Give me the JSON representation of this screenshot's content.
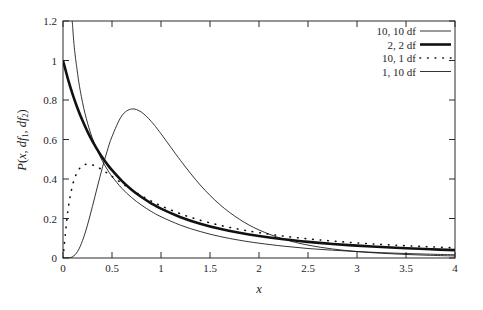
{
  "chart_data": {
    "type": "line",
    "title": "",
    "subtitle": "",
    "xlabel": "x",
    "ylabel": "P(x, df1, df2)",
    "ylabel_display": "P(x, df₁, df₂)",
    "xlim": [
      0,
      4
    ],
    "ylim": [
      0,
      1.2
    ],
    "grid": false,
    "legend_position": "top-right",
    "xticks": [
      "0",
      "0.5",
      "1",
      "1.5",
      "2",
      "2.5",
      "3",
      "3.5",
      "4"
    ],
    "xtick_values": [
      0,
      0.5,
      1,
      1.5,
      2,
      2.5,
      3,
      3.5,
      4
    ],
    "yticks": [
      "0",
      "0.2",
      "0.4",
      "0.6",
      "0.8",
      "1",
      "1.2"
    ],
    "ytick_values": [
      0,
      0.2,
      0.4,
      0.6,
      0.8,
      1,
      1.2
    ],
    "x": [
      0.0,
      0.05,
      0.1,
      0.15,
      0.2,
      0.25,
      0.3,
      0.35,
      0.4,
      0.45,
      0.5,
      0.6,
      0.7,
      0.8,
      0.9,
      1.0,
      1.2,
      1.4,
      1.6,
      1.8,
      2.0,
      2.25,
      2.5,
      2.75,
      3.0,
      3.25,
      3.5,
      3.75,
      4.0
    ],
    "series": [
      {
        "name": "10, 10 df",
        "df1": 10,
        "df2": 10,
        "style": "solid-thin",
        "color": "#111111",
        "values": [
          0.0,
          0.0003,
          0.0072,
          0.0339,
          0.0889,
          0.1673,
          0.2607,
          0.3589,
          0.454,
          0.5403,
          0.6147,
          0.72,
          0.7545,
          0.7385,
          0.6918,
          0.6291,
          0.4933,
          0.3697,
          0.2707,
          0.1961,
          0.142,
          0.0955,
          0.0653,
          0.0457,
          0.0327,
          0.0239,
          0.0178,
          0.0135,
          0.0104
        ]
      },
      {
        "name": "2, 2 df",
        "df1": 2,
        "df2": 2,
        "style": "solid-thick",
        "color": "#111111",
        "values": [
          1.0,
          0.907,
          0.8264,
          0.7561,
          0.6944,
          0.64,
          0.5917,
          0.5487,
          0.5102,
          0.4756,
          0.4444,
          0.3906,
          0.346,
          0.3086,
          0.277,
          0.25,
          0.2066,
          0.1736,
          0.1479,
          0.1276,
          0.1111,
          0.0946,
          0.0816,
          0.0711,
          0.0625,
          0.0554,
          0.0494,
          0.0443,
          0.04
        ]
      },
      {
        "name": "10, 1 df",
        "df1": 10,
        "df2": 1,
        "style": "dotted",
        "color": "#111111",
        "values": [
          0.0,
          0.239,
          0.373,
          0.4385,
          0.4674,
          0.4754,
          0.4715,
          0.4609,
          0.4465,
          0.4302,
          0.4131,
          0.3785,
          0.3456,
          0.3155,
          0.2884,
          0.2642,
          0.2236,
          0.1915,
          0.1659,
          0.1452,
          0.1283,
          0.1109,
          0.0971,
          0.0858,
          0.0765,
          0.0687,
          0.0621,
          0.0565,
          0.0516
        ]
      },
      {
        "name": "1, 10 df",
        "df1": 1,
        "df2": 10,
        "style": "solid-thin",
        "color": "#111111",
        "values": [
          3.5,
          1.672,
          1.161,
          0.93,
          0.786,
          0.684,
          0.606,
          0.544,
          0.493,
          0.45,
          0.413,
          0.353,
          0.306,
          0.268,
          0.236,
          0.209,
          0.166,
          0.134,
          0.109,
          0.09,
          0.075,
          0.06,
          0.048,
          0.0395,
          0.0325,
          0.027,
          0.0227,
          0.0192,
          0.0164
        ]
      }
    ],
    "annotations": []
  },
  "legend": {
    "entries": [
      {
        "label": "10, 10 df",
        "style": "solid-thin"
      },
      {
        "label": "2, 2 df",
        "style": "solid-thick"
      },
      {
        "label": "10, 1 df",
        "style": "dotted"
      },
      {
        "label": "1, 10 df",
        "style": "solid-thin"
      }
    ]
  },
  "axes": {
    "x_title": "x",
    "y_title_parts": {
      "p": "P",
      "open": "(",
      "x": "x",
      "comma1": ", ",
      "df": "df",
      "sub1": "1",
      "comma2": ", ",
      "df2": "df",
      "sub2": "2",
      "close": ")"
    }
  }
}
